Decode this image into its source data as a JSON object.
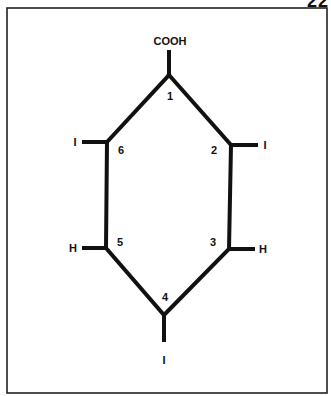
{
  "page": {
    "corner_text": "22"
  },
  "molecule": {
    "substituent_top": "COOH",
    "positions": [
      {
        "number": "1",
        "substituent": "COOH"
      },
      {
        "number": "2",
        "substituent": "I"
      },
      {
        "number": "3",
        "substituent": "H"
      },
      {
        "number": "4",
        "substituent": "I"
      },
      {
        "number": "5",
        "substituent": "H"
      },
      {
        "number": "6",
        "substituent": "I"
      }
    ],
    "labels": {
      "n1": "1",
      "n2": "2",
      "n3": "3",
      "n4": "4",
      "n5": "5",
      "n6": "6",
      "s1": "COOH",
      "s2": "I",
      "s3": "H",
      "s4": "I",
      "s5": "H",
      "s6": "I"
    }
  },
  "colors": {
    "line": "#111111",
    "frame": "#222222",
    "background": "#ffffff"
  }
}
